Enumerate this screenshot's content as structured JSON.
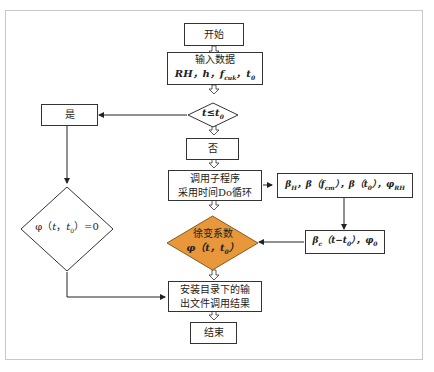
{
  "diagram": {
    "nodes": {
      "start": {
        "label": "开始"
      },
      "input": {
        "line1": "输入数据",
        "line2": "RH，h，f_cuk，t_0"
      },
      "condition": {
        "label": "t≤t_0"
      },
      "yes": {
        "label": "是"
      },
      "no": {
        "label": "否"
      },
      "subroutine": {
        "line1": "调用子程序",
        "line2": "采用时间Do循环"
      },
      "params1": {
        "label": "β_H，β（f_cm），β（t_0），φ_RH"
      },
      "params2": {
        "label": "β_c（t−t_0），φ_0"
      },
      "creep_coef": {
        "line1": "徐变系数",
        "line2": "φ（t，t_0）"
      },
      "zero": {
        "label": "φ（t，t_0）=0"
      },
      "output": {
        "line1": "安装目录下的输",
        "line2": "出文件调用结果"
      },
      "end": {
        "label": "结束"
      }
    },
    "colors": {
      "highlight_fill": "#E8973A",
      "highlight_stroke": "#8a5a1e",
      "line": "#333333",
      "frame": "#c8c8c8"
    }
  }
}
